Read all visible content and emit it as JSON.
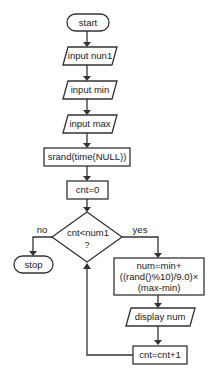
{
  "flowchart": {
    "nodes": [
      {
        "id": "start",
        "type": "terminal",
        "label": "start"
      },
      {
        "id": "input_num1",
        "type": "io",
        "label": "input nun1"
      },
      {
        "id": "input_min",
        "type": "io",
        "label": "input min"
      },
      {
        "id": "input_max",
        "type": "io",
        "label": "input max"
      },
      {
        "id": "srand",
        "type": "process",
        "label": "srand(time(NULL))"
      },
      {
        "id": "cnt_init",
        "type": "process",
        "label": "cnt=0"
      },
      {
        "id": "decision",
        "type": "decision",
        "label_line1": "cnt<num1",
        "label_line2": "?"
      },
      {
        "id": "stop",
        "type": "terminal",
        "label": "stop"
      },
      {
        "id": "compute",
        "type": "process",
        "label_line1": "num=min+",
        "label_line2": "((rand()%10)/9.0)×",
        "label_line3": "(max-min)"
      },
      {
        "id": "display",
        "type": "io",
        "label": "display num"
      },
      {
        "id": "increment",
        "type": "process",
        "label": "cnt=cnt+1"
      }
    ],
    "edge_labels": {
      "no": "no",
      "yes": "yes"
    },
    "colors": {
      "stroke": "#333333",
      "fill": "#ffffff",
      "text": "#222222"
    }
  }
}
